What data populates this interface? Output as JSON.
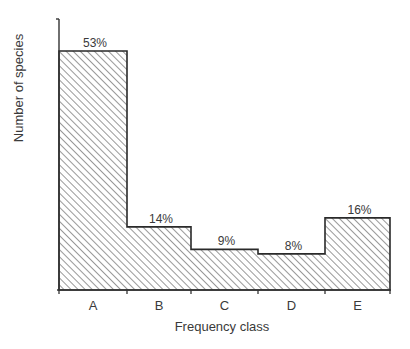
{
  "chart_data": {
    "type": "bar",
    "title": "",
    "xlabel": "Frequency class",
    "ylabel": "Number of species",
    "categories": [
      "A",
      "B",
      "C",
      "D",
      "E"
    ],
    "values": [
      53,
      14,
      9,
      8,
      16
    ],
    "value_labels": [
      "53%",
      "14%",
      "9%",
      "8%",
      "16%"
    ],
    "unit": "%",
    "ylim": [
      0,
      60
    ],
    "grid": false,
    "legend": "none",
    "fill": "diagonal-hatch",
    "bar_gap": 0
  }
}
